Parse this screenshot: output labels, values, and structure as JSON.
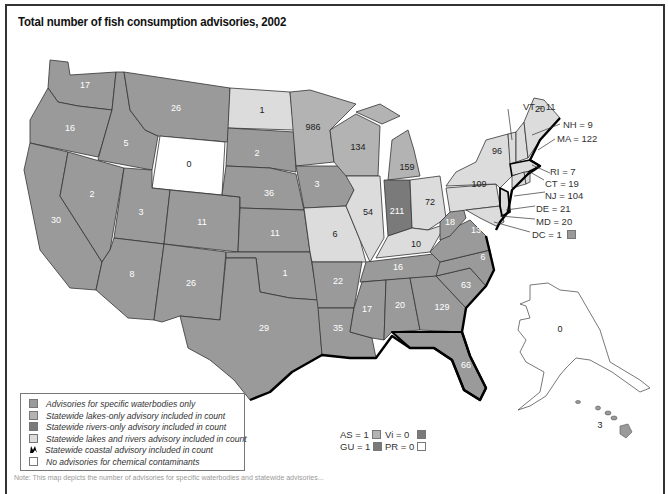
{
  "title": "Total number of fish consumption advisories, 2002",
  "colors": {
    "specific_waterbodies": "#9a9a9a",
    "lakes_only": "#b3b3b3",
    "rivers_only": "#7a7a7a",
    "lakes_and_rivers": "#dcdcdc",
    "coastal": "#000000",
    "none": "#ffffff",
    "border": "#333333"
  },
  "legend": {
    "items": [
      {
        "key": "specific_waterbodies",
        "label": "Advisories for specific waterbodies only"
      },
      {
        "key": "lakes_only",
        "label": "Statewide lakes-only advisory included in count"
      },
      {
        "key": "rivers_only",
        "label": "Statewide rivers-only advisory included in count"
      },
      {
        "key": "lakes_and_rivers",
        "label": "Statewide lakes and rivers advisory included in count"
      },
      {
        "key": "coastal",
        "label": "Statewide coastal advisory included in count"
      },
      {
        "key": "none",
        "label": "No advisories for chemical contaminants"
      }
    ]
  },
  "states": [
    {
      "abbr": "WA",
      "value": "17"
    },
    {
      "abbr": "OR",
      "value": "16"
    },
    {
      "abbr": "CA",
      "value": "30"
    },
    {
      "abbr": "ID",
      "value": "5"
    },
    {
      "abbr": "NV",
      "value": "2"
    },
    {
      "abbr": "MT",
      "value": "26"
    },
    {
      "abbr": "WY",
      "value": "0"
    },
    {
      "abbr": "UT",
      "value": "3"
    },
    {
      "abbr": "AZ",
      "value": "8"
    },
    {
      "abbr": "CO",
      "value": "11"
    },
    {
      "abbr": "NM",
      "value": "26"
    },
    {
      "abbr": "ND",
      "value": "1"
    },
    {
      "abbr": "SD",
      "value": "2"
    },
    {
      "abbr": "NE",
      "value": "36"
    },
    {
      "abbr": "KS",
      "value": "11"
    },
    {
      "abbr": "OK",
      "value": "1"
    },
    {
      "abbr": "TX",
      "value": "29"
    },
    {
      "abbr": "MN",
      "value": "986"
    },
    {
      "abbr": "IA",
      "value": "3"
    },
    {
      "abbr": "MO",
      "value": "6"
    },
    {
      "abbr": "AR",
      "value": "22"
    },
    {
      "abbr": "LA",
      "value": "35"
    },
    {
      "abbr": "WI",
      "value": "134"
    },
    {
      "abbr": "IL",
      "value": "54"
    },
    {
      "abbr": "MI",
      "value": "159"
    },
    {
      "abbr": "IN",
      "value": "211"
    },
    {
      "abbr": "OH",
      "value": "72"
    },
    {
      "abbr": "KY",
      "value": "10"
    },
    {
      "abbr": "TN",
      "value": "16"
    },
    {
      "abbr": "MS",
      "value": "17"
    },
    {
      "abbr": "AL",
      "value": "20"
    },
    {
      "abbr": "GA",
      "value": "129"
    },
    {
      "abbr": "FL",
      "value": "66"
    },
    {
      "abbr": "SC",
      "value": "63"
    },
    {
      "abbr": "NC",
      "value": "6"
    },
    {
      "abbr": "VA",
      "value": "13"
    },
    {
      "abbr": "WV",
      "value": "18"
    },
    {
      "abbr": "PA",
      "value": "109"
    },
    {
      "abbr": "NY",
      "value": "96"
    },
    {
      "abbr": "ME",
      "value": "20"
    },
    {
      "abbr": "AK",
      "value": "0"
    },
    {
      "abbr": "HI",
      "value": "3"
    }
  ],
  "northeast_callouts": [
    {
      "label": "VT = 11"
    },
    {
      "label": "NH = 9"
    },
    {
      "label": "MA = 122"
    },
    {
      "label": "RI = 7"
    },
    {
      "label": "CT = 19"
    },
    {
      "label": "NJ = 104"
    },
    {
      "label": "DE = 21"
    },
    {
      "label": "MD = 20"
    },
    {
      "label": "DC = 1"
    }
  ],
  "territories": [
    {
      "label": "AS = 1"
    },
    {
      "label": "Vi = 0"
    },
    {
      "label": "GU = 1"
    },
    {
      "label": "PR = 0"
    }
  ],
  "note": "Note: This map depicts the number of advisories for specific waterbodies and statewide advisories..."
}
